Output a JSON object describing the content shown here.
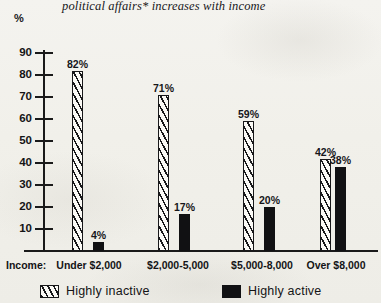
{
  "chart_data": {
    "type": "bar",
    "title": "political affairs* increases with income",
    "xlabel": "Income:",
    "ylabel": "%",
    "ylim": [
      0,
      90
    ],
    "grid": false,
    "legend_position": "bottom",
    "categories": [
      "Under $2,000",
      "$2,000-5,000",
      "$5,000-8,000",
      "Over $8,000"
    ],
    "ytick_labels": [
      "90",
      "80",
      "70",
      "60",
      "50",
      "40",
      "30",
      "20",
      "10"
    ],
    "yticks": [
      90,
      80,
      70,
      60,
      50,
      40,
      30,
      20,
      10
    ],
    "series": [
      {
        "name": "Highly inactive",
        "fill": "hatched",
        "values": [
          82,
          71,
          59,
          42
        ],
        "value_labels": [
          "82%",
          "71%",
          "59%",
          "42%"
        ]
      },
      {
        "name": "Highly active",
        "fill": "solid",
        "values": [
          4,
          17,
          20,
          38
        ],
        "value_labels": [
          "4%",
          "17%",
          "20%",
          "38%"
        ]
      }
    ]
  },
  "axis": {
    "unit_label": "%",
    "income_prefix": "Income:"
  },
  "legend": {
    "items": [
      {
        "label": "Highly inactive",
        "fill": "hatched"
      },
      {
        "label": "Highly active",
        "fill": "solid"
      }
    ]
  },
  "colors": {
    "ink": "#18181a",
    "paper": "#f2f1ec",
    "bar_solid": "#111113",
    "bar_hatch_bg": "#fbfaf6"
  }
}
